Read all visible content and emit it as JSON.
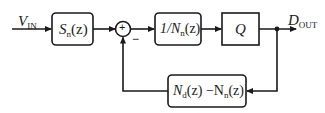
{
  "diagram": {
    "type": "block-diagram",
    "input": {
      "symbol": "V",
      "subscript": "IN"
    },
    "output": {
      "symbol": "D",
      "subscript": "OUT"
    },
    "blocks": [
      {
        "id": "sn",
        "pre": "S",
        "sub": "n",
        "post": "(z)"
      },
      {
        "id": "inv_nn",
        "pre": "1/N",
        "sub": "n",
        "post": "(z)"
      },
      {
        "id": "quantizer",
        "label": "Q"
      },
      {
        "id": "feedback",
        "pre": "N",
        "sub": "d",
        "mid": "(z) −N",
        "sub2": "n",
        "post": "(z)"
      }
    ],
    "summing_junction": {
      "symbol": "+",
      "feedback_sign": "−"
    },
    "colors": {
      "stroke": "#1a1a1a",
      "background": "#ffffff"
    }
  }
}
